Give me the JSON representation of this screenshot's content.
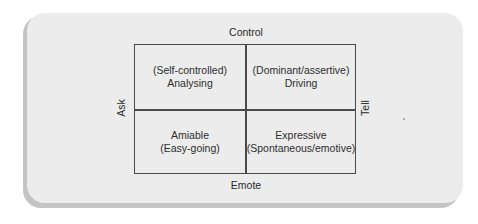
{
  "diagram": {
    "axes": {
      "top": "Control",
      "bottom": "Emote",
      "left": "Ask",
      "right": "Tell"
    },
    "quadrants": {
      "top_left": {
        "line1": "(Self-controlled)",
        "line2": "Analysing"
      },
      "top_right": {
        "line1": "(Dominant/assertive)",
        "line2": "Driving"
      },
      "bottom_left": {
        "line1": "Amiable",
        "line2": "(Easy-going)"
      },
      "bottom_right": {
        "line1": "Expressive",
        "line2": "(Spontaneous/emotive)"
      }
    }
  }
}
